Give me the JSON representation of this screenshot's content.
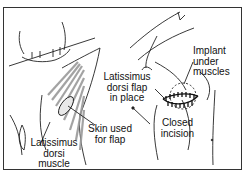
{
  "diagram": {
    "left_panel": {
      "labels": {
        "skin": "Skin used\nfor flap",
        "muscle": "Latissimus\ndorsi\nmuscle"
      }
    },
    "right_panel": {
      "labels": {
        "flap": "Latissimus\ndorsi flap\nin place",
        "implant": "Implant\nunder\nmuscles",
        "incision": "Closed\nincision"
      }
    },
    "colors": {
      "line": "#222222",
      "muscle_shading": "#9a9a9a",
      "frame": "#333333"
    }
  }
}
